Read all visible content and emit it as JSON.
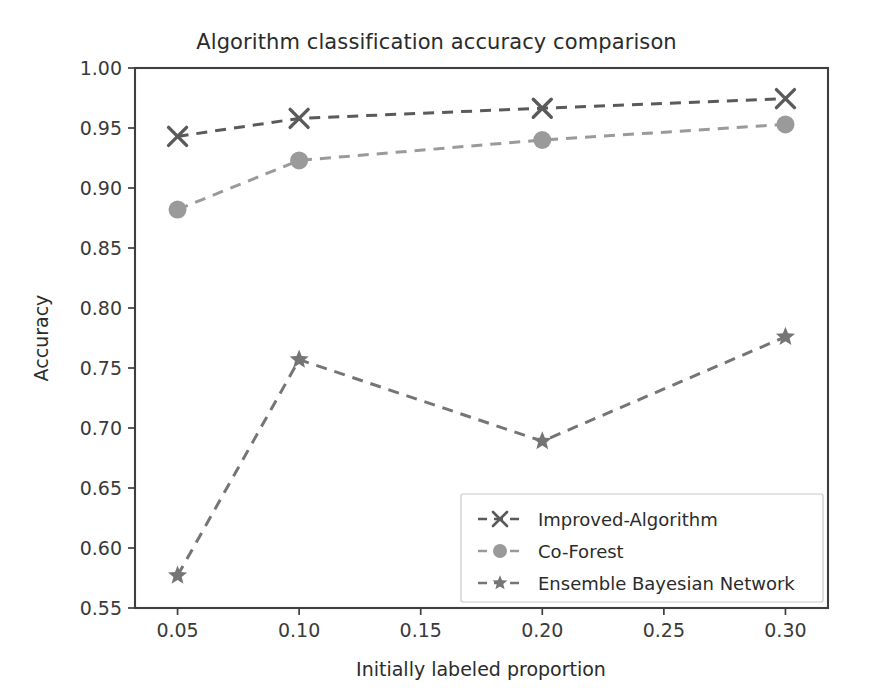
{
  "chart_data": {
    "type": "line",
    "title": "Algorithm classification accuracy comparison",
    "xlabel": "Initially labeled proportion",
    "ylabel": "Accuracy",
    "x": [
      0.05,
      0.1,
      0.2,
      0.3
    ],
    "xlim": [
      0.0325,
      0.3175
    ],
    "ylim": [
      0.55,
      1.0
    ],
    "xticks": [
      0.05,
      0.1,
      0.15,
      0.2,
      0.25,
      0.3
    ],
    "xtick_labels": [
      "0.05",
      "0.10",
      "0.15",
      "0.20",
      "0.25",
      "0.30"
    ],
    "yticks": [
      0.55,
      0.6,
      0.65,
      0.7,
      0.75,
      0.8,
      0.85,
      0.9,
      0.95,
      1.0
    ],
    "ytick_labels": [
      "0.55",
      "0.60",
      "0.65",
      "0.70",
      "0.75",
      "0.80",
      "0.85",
      "0.90",
      "0.95",
      "1.00"
    ],
    "grid": false,
    "legend_position": "lower right",
    "linestyle": "dashed",
    "series": [
      {
        "name": "Improved-Algorithm",
        "marker": "x",
        "color": "#5a5a5a",
        "values": [
          0.943,
          0.958,
          0.9665,
          0.9745
        ]
      },
      {
        "name": "Co-Forest",
        "marker": "circle",
        "color": "#9a9a9a",
        "values": [
          0.882,
          0.923,
          0.94,
          0.953
        ]
      },
      {
        "name": "Ensemble Bayesian Network",
        "marker": "star",
        "color": "#757575",
        "values": [
          0.577,
          0.757,
          0.689,
          0.776
        ]
      }
    ]
  },
  "legend": {
    "entries": [
      "Improved-Algorithm",
      "Co-Forest",
      "Ensemble Bayesian Network"
    ]
  },
  "colors": {
    "axis": "#3f3f3f",
    "text": "#2b2b2b",
    "background": "#ffffff"
  }
}
